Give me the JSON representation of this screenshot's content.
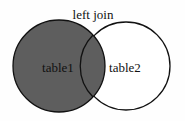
{
  "diagram": {
    "title": "left join",
    "sets": [
      {
        "label": "table1",
        "fill": "#5e5e5e",
        "highlighted": true
      },
      {
        "label": "table2",
        "fill": "#ffffff",
        "highlighted": false
      }
    ],
    "colors": {
      "stroke": "#111111",
      "shaded": "#5e5e5e",
      "background": "#fefefe"
    }
  }
}
